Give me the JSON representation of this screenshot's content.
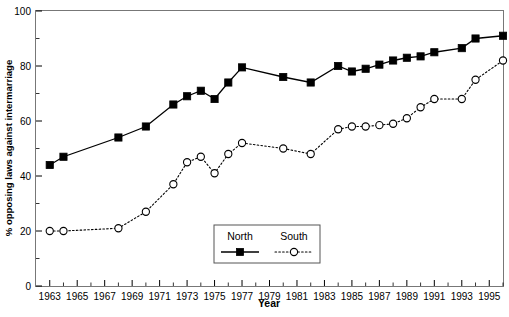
{
  "chart_data": {
    "type": "line",
    "title": "",
    "xlabel": "Year",
    "ylabel": "% opposing laws against intermarriage",
    "xlim": [
      1962,
      1996
    ],
    "ylim": [
      0,
      100
    ],
    "yticks": [
      0,
      20,
      40,
      60,
      80,
      100
    ],
    "xticks": [
      1963,
      1965,
      1967,
      1969,
      1971,
      1973,
      1975,
      1977,
      1979,
      1981,
      1983,
      1985,
      1987,
      1989,
      1991,
      1993,
      1995
    ],
    "xtick_labels": [
      "1963",
      "1965",
      "1967",
      "1969",
      "1971",
      "1973",
      "1975",
      "1977",
      "1979",
      "1981",
      "1983",
      "1985",
      "1987",
      "1989",
      "1991",
      "1993",
      "1995"
    ],
    "ytick_labels": [
      "0",
      "20",
      "40",
      "60",
      "80",
      "100"
    ],
    "grid": false,
    "legend_position": "lower-center",
    "x": [
      1963,
      1964,
      1968,
      1970,
      1972,
      1973,
      1974,
      1975,
      1976,
      1977,
      1980,
      1982,
      1984,
      1985,
      1986,
      1987,
      1988,
      1989,
      1990,
      1991,
      1993,
      1994,
      1996
    ],
    "series": [
      {
        "name": "North",
        "marker": "filled-square",
        "linestyle": "solid",
        "color": "#000000",
        "values": [
          44,
          47,
          54,
          58,
          66,
          69,
          71,
          68,
          74,
          79.5,
          76,
          74,
          80,
          78,
          79,
          80.5,
          82,
          83,
          83.5,
          85,
          86.5,
          90,
          91
        ]
      },
      {
        "name": "South",
        "marker": "open-circle",
        "linestyle": "dotted",
        "color": "#000000",
        "values": [
          20,
          20,
          21,
          27,
          37,
          45,
          47,
          41,
          48,
          52,
          50,
          48,
          57,
          58,
          58,
          58.5,
          59,
          61,
          65,
          68,
          68,
          75,
          82
        ]
      }
    ],
    "legend": [
      {
        "label": "North",
        "marker": "filled-square",
        "linestyle": "solid"
      },
      {
        "label": "South",
        "marker": "open-circle",
        "linestyle": "dotted"
      }
    ]
  }
}
